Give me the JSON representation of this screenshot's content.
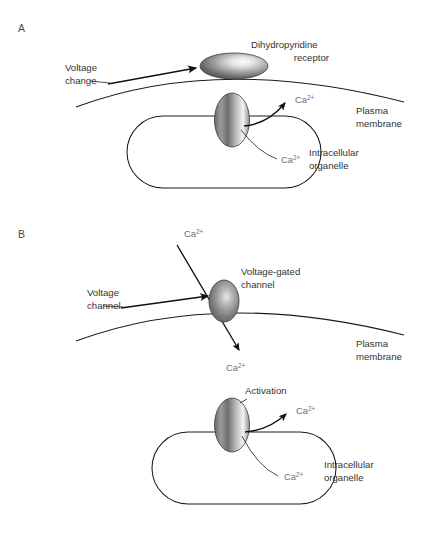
{
  "figure": {
    "background_color": "#ffffff",
    "panels": [
      {
        "id": "A",
        "label": "A",
        "description": "Dihydropyridine receptor coupling plasma membrane to intracellular organelle",
        "annotations": {
          "stimulus_label_line1": "Voltage",
          "stimulus_label_line2": "change",
          "protein_label_line1": "Dihydropyridine",
          "protein_label_line2": "receptor",
          "membrane_label_line1": "Plasma",
          "membrane_label_line2": "membrane",
          "organelle_label_line1": "Intracellular",
          "organelle_label_line2": "organelle",
          "ion_efflux": "Ca",
          "ion_efflux_charge": "2+",
          "ion_store": "Ca",
          "ion_store_charge": "2+"
        }
      },
      {
        "id": "B",
        "label": "B",
        "description": "Voltage-gated channel admits extracellular calcium which then activates organelle release",
        "annotations": {
          "stimulus_label_line1": "Voltage",
          "stimulus_label_line2": "channel",
          "protein_label_line1": "Voltage-gated",
          "protein_label_line2": "channel",
          "membrane_label_line1": "Plasma",
          "membrane_label_line2": "membrane",
          "organelle_label_line1": "Intracellular",
          "organelle_label_line2": "organelle",
          "activation_label": "Activation",
          "ion_extracellular": "Ca",
          "ion_extracellular_charge": "2+",
          "ion_influx": "Ca",
          "ion_influx_charge": "2+",
          "ion_efflux": "Ca",
          "ion_efflux_charge": "2+",
          "ion_store": "Ca",
          "ion_store_charge": "2+"
        }
      }
    ],
    "colors": {
      "line": "#1c1c1c",
      "text": "#333333",
      "ion_text": "#6d6d6d",
      "panel_label": "#4a4a4a",
      "protein_dark": "#4b4b4b",
      "protein_mid": "#8c8c8c",
      "protein_light": "#f2f2f2",
      "protein_edge": "#3b3b3b"
    }
  }
}
